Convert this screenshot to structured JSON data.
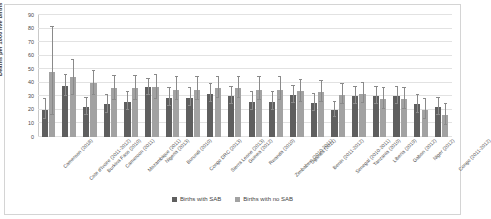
{
  "chart_data": {
    "type": "bar",
    "title": "",
    "xlabel": "",
    "ylabel": "Deaths per 1000 live births",
    "ylim": [
      0,
      90
    ],
    "ytick_step": 10,
    "yticks": [
      0,
      10,
      20,
      30,
      40,
      50,
      60,
      70,
      80,
      90
    ],
    "grid": true,
    "legend_position": "bottom",
    "error_bars": true,
    "colors": {
      "series_sab": "#5f5f5f",
      "series_no_sab": "#a2a2a2",
      "gridline": "#e2e2e2",
      "axis": "#c9c9c9",
      "text": "#4a4a4a"
    },
    "categories": [
      "Cameroon (2018)",
      "Cote d'Ivoire (2011-2012)",
      "Burkina Faso (2010)",
      "Cameroon (2011)",
      "Mozambique (2011)",
      "Nigeria (2013)",
      "Burundi (2010)",
      "Congo DRC  (2013)",
      "Sierra Leone (2013)",
      "Guinea (2012)",
      "Rwanda (2010)",
      "Zimbabwe (2010-2011)",
      "Uganda (2011)",
      "Benin (2011-2012)",
      "Senegal (2010-2011)",
      "Tanzania (2010)",
      "Liberia (2019)",
      "Gabon (2012)",
      "Niger (2012)",
      "Congo (2011-2012)"
    ],
    "series": [
      {
        "name": "Births with SAB",
        "values": [
          20,
          38,
          22,
          24,
          26,
          37,
          29,
          29,
          32,
          30,
          26,
          26,
          31,
          25,
          20,
          30,
          30,
          30,
          24,
          22
        ],
        "err_low": [
          13,
          30,
          16,
          18,
          20,
          31,
          23,
          23,
          26,
          24,
          20,
          20,
          25,
          19,
          15,
          24,
          24,
          24,
          18,
          16
        ],
        "err_high": [
          28,
          46,
          29,
          31,
          33,
          43,
          36,
          36,
          39,
          37,
          33,
          33,
          38,
          32,
          26,
          37,
          37,
          37,
          31,
          29
        ]
      },
      {
        "name": "Births with no SAB",
        "values": [
          48,
          44,
          40,
          36,
          36,
          37,
          35,
          35,
          36,
          36,
          35,
          35,
          34,
          33,
          31,
          32,
          28,
          28,
          20,
          16
        ],
        "err_low": [
          16,
          31,
          31,
          27,
          27,
          28,
          27,
          27,
          29,
          29,
          27,
          27,
          26,
          26,
          24,
          25,
          21,
          21,
          13,
          9
        ],
        "err_high": [
          81,
          57,
          49,
          45,
          45,
          46,
          44,
          44,
          44,
          44,
          44,
          44,
          42,
          41,
          39,
          40,
          36,
          36,
          28,
          24
        ]
      }
    ]
  },
  "legend": {
    "items": [
      {
        "label": "Births with SAB"
      },
      {
        "label": "Births with no SAB"
      }
    ]
  }
}
